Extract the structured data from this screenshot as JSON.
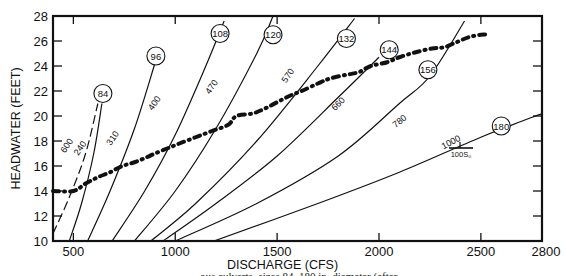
{
  "chart_data": {
    "type": "line",
    "title": "",
    "xlabel": "DISCHARGE (CFS)",
    "ylabel": "HEADWATER (FEET)",
    "xlim": [
      400,
      2800
    ],
    "ylim": [
      10,
      28
    ],
    "x_ticks": [
      500,
      1000,
      1500,
      2000,
      2500,
      2800
    ],
    "y_ticks": [
      10,
      12,
      14,
      16,
      18,
      20,
      22,
      24,
      26,
      28
    ],
    "grid": false,
    "legend_annotation": "L / 100S₀",
    "curves": [
      {
        "name": "84",
        "style": "solid",
        "points": [
          [
            480,
            10
          ],
          [
            540,
            13
          ],
          [
            600,
            17
          ],
          [
            640,
            21
          ]
        ],
        "circle_at": [
          645,
          21.8
        ]
      },
      {
        "name": "84-dashed",
        "style": "dashed",
        "points": [
          [
            400,
            10.6
          ],
          [
            480,
            13.5
          ],
          [
            560,
            17
          ],
          [
            620,
            21
          ]
        ]
      },
      {
        "name": "96",
        "style": "solid",
        "points": [
          [
            570,
            10
          ],
          [
            680,
            14
          ],
          [
            800,
            19
          ],
          [
            900,
            24.2
          ]
        ],
        "circle_at": [
          905,
          24.8
        ]
      },
      {
        "name": "108",
        "style": "solid",
        "points": [
          [
            690,
            10
          ],
          [
            850,
            14
          ],
          [
            1000,
            18.5
          ],
          [
            1150,
            24
          ],
          [
            1240,
            27.6
          ]
        ],
        "circle_at": [
          1220,
          26.6
        ]
      },
      {
        "name": "120",
        "style": "solid",
        "points": [
          [
            800,
            10
          ],
          [
            1000,
            14
          ],
          [
            1200,
            19
          ],
          [
            1400,
            25
          ],
          [
            1480,
            28
          ]
        ],
        "circle_at": [
          1480,
          26.5
        ]
      },
      {
        "name": "132",
        "style": "solid",
        "points": [
          [
            880,
            10
          ],
          [
            1100,
            13
          ],
          [
            1400,
            18
          ],
          [
            1700,
            24
          ],
          [
            1880,
            27.8
          ]
        ],
        "circle_at": [
          1840,
          26.2
        ]
      },
      {
        "name": "144",
        "style": "solid",
        "points": [
          [
            940,
            10
          ],
          [
            1200,
            13
          ],
          [
            1500,
            16.8
          ],
          [
            1800,
            21.5
          ],
          [
            2000,
            24.7
          ]
        ],
        "circle_at": [
          2050,
          25.3
        ]
      },
      {
        "name": "156",
        "style": "solid",
        "points": [
          [
            1000,
            10
          ],
          [
            1400,
            13
          ],
          [
            1800,
            16.8
          ],
          [
            2100,
            21
          ],
          [
            2250,
            23.2
          ],
          [
            2420,
            27.6
          ]
        ],
        "circle_at": [
          2240,
          23.7
        ]
      },
      {
        "name": "180",
        "style": "solid",
        "points": [
          [
            1190,
            10
          ],
          [
            1700,
            13
          ],
          [
            2100,
            15.5
          ],
          [
            2500,
            18.3
          ],
          [
            2800,
            20.2
          ]
        ],
        "circle_at": [
          2600,
          19.2
        ]
      }
    ],
    "curve_labels": [
      {
        "text": "600",
        "at": [
          480,
          17.5
        ]
      },
      {
        "text": "240",
        "at": [
          545,
          17.3
        ]
      },
      {
        "text": "310",
        "at": [
          705,
          18.1
        ]
      },
      {
        "text": "400",
        "at": [
          910,
          20.9
        ]
      },
      {
        "text": "470",
        "at": [
          1190,
          22.2
        ]
      },
      {
        "text": "570",
        "at": [
          1565,
          23.1
        ]
      },
      {
        "text": "660",
        "at": [
          1810,
          20.8
        ]
      },
      {
        "text": "780",
        "at": [
          2110,
          19.4
        ]
      },
      {
        "text": "1000",
        "at": [
          2360,
          17.7
        ]
      }
    ],
    "series": [
      {
        "name": "Headwater trace (dash-dot)",
        "style": "dash-dot",
        "x": [
          400,
          500,
          560,
          620,
          680,
          740,
          800,
          860,
          900,
          960,
          1020,
          1100,
          1180,
          1260,
          1300,
          1380,
          1440,
          1500,
          1560,
          1620,
          1700,
          1760,
          1840,
          1900,
          1960,
          2040,
          2100,
          2180,
          2260,
          2320,
          2380,
          2440,
          2500,
          2540
        ],
        "y": [
          14,
          14,
          14.6,
          15.1,
          15.5,
          16,
          16.3,
          16.7,
          17,
          17.4,
          17.8,
          18.3,
          18.8,
          19.3,
          20,
          20.2,
          20.6,
          21.1,
          21.6,
          22,
          22.6,
          23,
          23.3,
          23.5,
          24,
          24.3,
          24.7,
          25.1,
          25.4,
          25.5,
          25.9,
          26.3,
          26.5,
          26.5
        ]
      }
    ]
  },
  "caption": "ous culverts, sizes 84–180 in. diameter (after"
}
